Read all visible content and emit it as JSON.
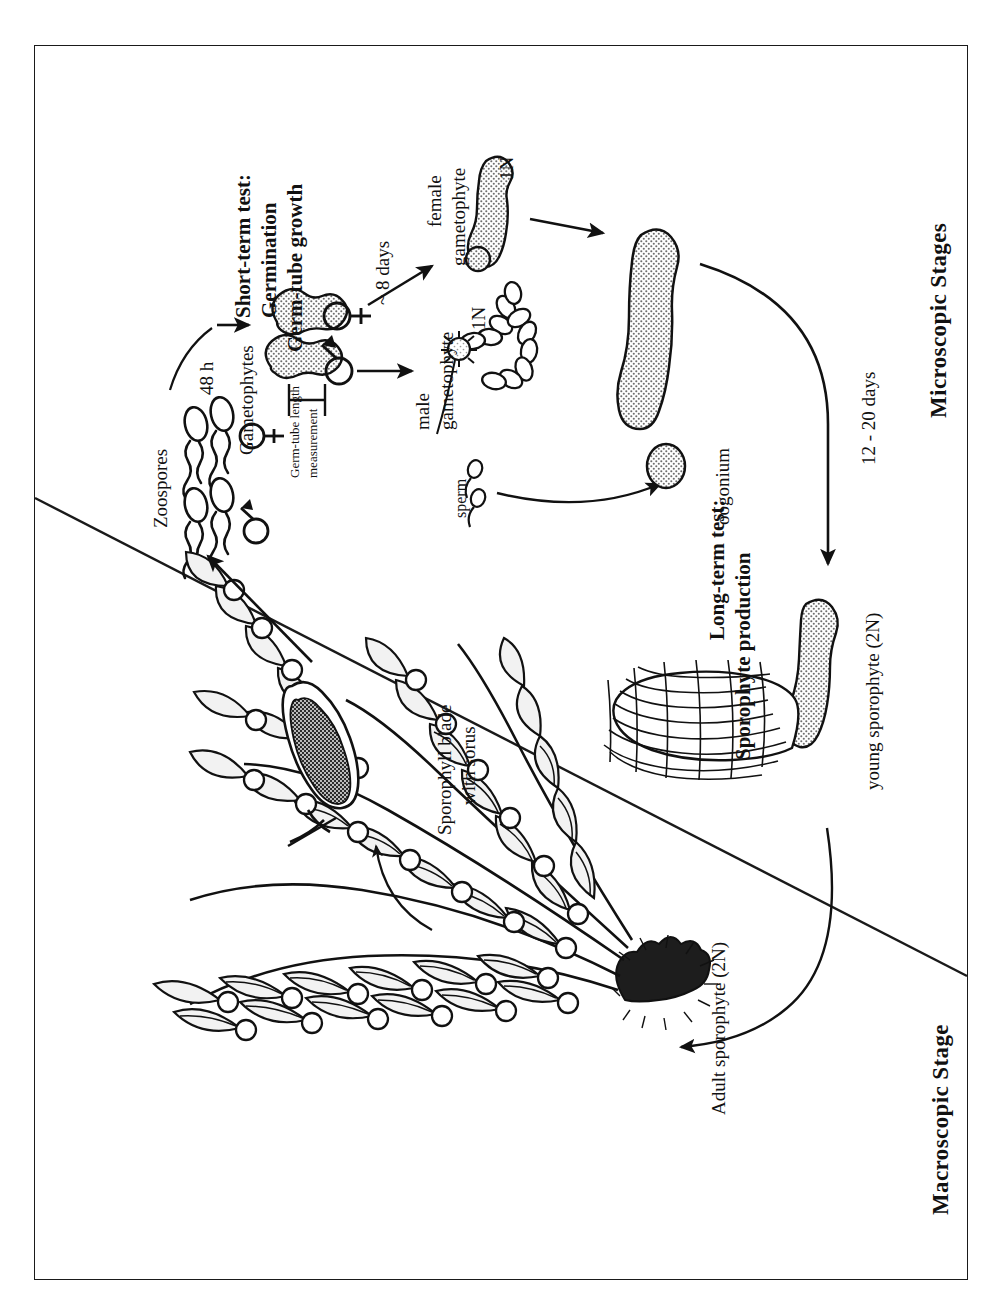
{
  "figure": {
    "frame_color": "#1a1a1a",
    "background": "#ffffff",
    "text_orientation": "rotated-90-ccw"
  },
  "sections": {
    "microscopic": "Microscopic Stages",
    "macroscopic": "Macroscopic Stage"
  },
  "tests": {
    "short_term_line1": "Short-term test:",
    "short_term_line2": "Germination",
    "short_term_line3": "Germ-tube growth",
    "long_term_line1": "Long-term test:",
    "long_term_line2": "Sporophyte production"
  },
  "labels": {
    "zoospores": "Zoospores",
    "gametophytes": "Gametophytes",
    "germ_tube_line1": "Germ-tube length",
    "germ_tube_line2": "measurement",
    "female_gametophyte_line1": "female",
    "female_gametophyte_line2": "gametophyte",
    "male_gametophyte_line1": "male",
    "male_gametophyte_line2": "gametophyte",
    "sperm": "sperm",
    "oogonium": "oogonium",
    "young_sporophyte": "young sporophyte (2N)",
    "adult_sporophyte": "Adult sporophyte (2N)",
    "sporophyll_line1": "Sporophyll blade",
    "sporophyll_line2": "with sorus"
  },
  "timings": {
    "zoospores_to_gametophytes": "48 h",
    "gametophyte_maturation": "~ 8 days",
    "sporophyte_development": "12 - 20 days"
  },
  "ploidy": {
    "female_gametophyte": "1N",
    "male_gametophyte": "1N",
    "young_sporophyte": "2N",
    "adult_sporophyte": "2N"
  },
  "symbols": {
    "female": "♀",
    "male": "♂"
  },
  "icons": {
    "zoospore": "zoospore-icon",
    "gametophyte_cell": "gametophyte-cell-icon",
    "female_gametophyte": "female-gametophyte-icon",
    "male_gametophyte": "male-gametophyte-icon",
    "sperm": "sperm-icon",
    "oogonium": "oogonium-icon",
    "young_sporophyte": "young-sporophyte-icon",
    "adult_sporophyte": "adult-kelp-icon",
    "sporophyll": "sporophyll-blade-icon",
    "divider": "diagonal-divider-icon"
  },
  "colors": {
    "ink": "#111111",
    "stipple_fill": "#d9d9d9",
    "sorus_fill": "#2b2b2b",
    "holdfast_fill": "#1d1d1d",
    "blade_fill": "#e8e8e8"
  }
}
